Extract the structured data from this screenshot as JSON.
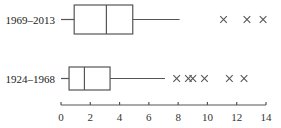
{
  "chart_data": {
    "type": "boxplot",
    "title": "",
    "xlabel": "",
    "ylabel": "",
    "xlim": [
      0,
      14
    ],
    "x_ticks": [
      0,
      2,
      4,
      6,
      8,
      10,
      12,
      14
    ],
    "x_tick_labels": [
      "0",
      "2",
      "4",
      "6",
      "8",
      "10",
      "12",
      "14"
    ],
    "grid": false,
    "legend": null,
    "series": [
      {
        "name": "1969–2013",
        "whisker_low": 0,
        "q1": 0.9,
        "median": 3.1,
        "q3": 4.9,
        "whisker_high": 8.1,
        "outliers": [
          11.1,
          12.7,
          13.8
        ]
      },
      {
        "name": "1924–1968",
        "whisker_low": 0,
        "q1": 0.55,
        "median": 1.6,
        "q3": 3.35,
        "whisker_high": 7.1,
        "outliers": [
          7.9,
          8.7,
          9.0,
          9.8,
          11.5,
          12.5
        ]
      }
    ]
  },
  "colors": {
    "stroke": "#555555",
    "outlier": "#555555",
    "text": "#222222"
  }
}
